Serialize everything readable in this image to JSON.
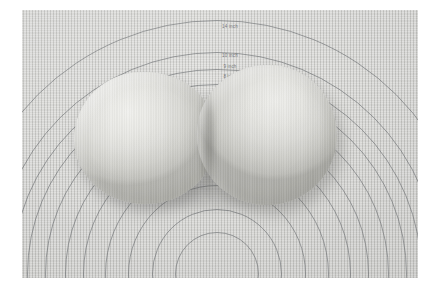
{
  "image": {
    "subject": "two-dough-balls-on-pastry-mat",
    "border_color": "#ffffff",
    "mat_color": "#cfcfcc",
    "ring_color": "#686a6e",
    "dough_color": "#e8e8e4",
    "photo": {
      "left": 22,
      "top": 10,
      "width": 396,
      "height": 268
    }
  },
  "mat": {
    "name": "silicone-pastry-mat",
    "center": {
      "x": 195,
      "y": 264
    },
    "rings": [
      {
        "label": "14 inch",
        "radius": 254,
        "label_y": 14
      },
      {
        "label": "10 inch",
        "radius": 222,
        "label_y": 43
      },
      {
        "label": "9 inch",
        "radius": 205,
        "label_y": 54
      },
      {
        "label": "8 inch",
        "radius": 190,
        "label_y": 64
      },
      {
        "label": "7 inch",
        "radius": 172,
        "label_y": 76
      },
      {
        "label": "6 inch",
        "radius": 152,
        "label_y": 90
      },
      {
        "label": "5 inch",
        "radius": 134,
        "label_y": 102
      }
    ],
    "label_x": 208
  },
  "dough": [
    {
      "name": "dough-ball-left",
      "position": "left"
    },
    {
      "name": "dough-ball-right",
      "position": "right"
    }
  ],
  "alt": "Two pale rounds of proofed bread dough resting side by side and touching in the middle of a light grey silicone pastry mat printed with concentric inch-measurement circles."
}
